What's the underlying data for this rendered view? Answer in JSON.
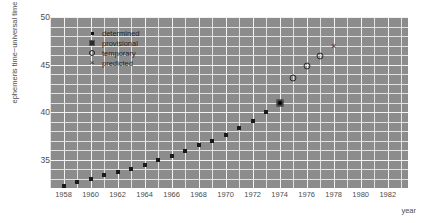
{
  "chart_data": {
    "type": "scatter",
    "title": "",
    "xlabel": "year",
    "ylabel": "ephemeris time−universal time",
    "xlim": [
      1957.0,
      1983.5
    ],
    "ylim": [
      32.0,
      50.0
    ],
    "xticks": [
      1958,
      1960,
      1962,
      1964,
      1966,
      1968,
      1970,
      1972,
      1974,
      1976,
      1978,
      1980,
      1982
    ],
    "yticks": [
      35,
      40,
      45,
      50
    ],
    "grid": true,
    "legend_position": "upper-left-inside",
    "legend": [
      {
        "marker": "determined",
        "label": "determined"
      },
      {
        "marker": "provisional",
        "label": "provisional"
      },
      {
        "marker": "temporary",
        "label": "temporary"
      },
      {
        "marker": "predicted",
        "label": "predicted"
      }
    ],
    "series": [
      {
        "name": "determined",
        "marker": "determined",
        "points": [
          {
            "x": 1958.0,
            "y": 32.2
          },
          {
            "x": 1959.0,
            "y": 32.6
          },
          {
            "x": 1960.0,
            "y": 33.0
          },
          {
            "x": 1961.0,
            "y": 33.4
          },
          {
            "x": 1962.0,
            "y": 33.7
          },
          {
            "x": 1963.0,
            "y": 34.0
          },
          {
            "x": 1964.0,
            "y": 34.4
          },
          {
            "x": 1965.0,
            "y": 34.9
          },
          {
            "x": 1966.0,
            "y": 35.4
          },
          {
            "x": 1967.0,
            "y": 35.9
          },
          {
            "x": 1968.0,
            "y": 36.5
          },
          {
            "x": 1969.0,
            "y": 37.0
          },
          {
            "x": 1970.0,
            "y": 37.6
          },
          {
            "x": 1971.0,
            "y": 38.3
          },
          {
            "x": 1972.0,
            "y": 39.1
          },
          {
            "x": 1973.0,
            "y": 40.0
          }
        ]
      },
      {
        "name": "provisional",
        "marker": "provisional",
        "points": [
          {
            "x": 1974.0,
            "y": 41.0
          }
        ]
      },
      {
        "name": "temporary",
        "marker": "temporary",
        "points": [
          {
            "x": 1975.0,
            "y": 43.6
          },
          {
            "x": 1976.0,
            "y": 44.8
          },
          {
            "x": 1977.0,
            "y": 45.9
          }
        ]
      },
      {
        "name": "predicted",
        "marker": "predicted",
        "points": [
          {
            "x": 1978.0,
            "y": 47.0
          }
        ]
      }
    ],
    "colors": {
      "plot_background": "#8c8c8c",
      "gridline": "#f2f2f2",
      "marker": "#1a1a1a",
      "text": "#4d4d4d",
      "figure_background": "#ffffff"
    }
  }
}
